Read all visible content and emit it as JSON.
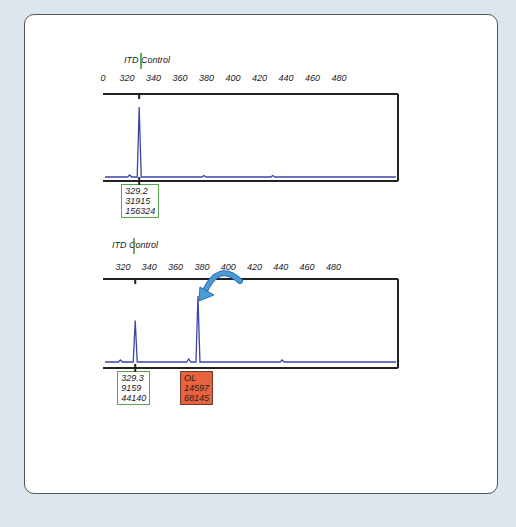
{
  "chart_data": [
    {
      "type": "line",
      "title": "ITD Control",
      "xlabel": "",
      "ylabel": "",
      "xlim": [
        310,
        500
      ],
      "x_ticks": [
        300,
        320,
        340,
        360,
        380,
        400,
        420,
        440,
        460,
        480
      ],
      "x_tick_labels": [
        "0",
        "320",
        "340",
        "360",
        "380",
        "400",
        "420",
        "440",
        "460",
        "480"
      ],
      "series": [
        {
          "name": "ITD Control trace",
          "color": "#3c46a8",
          "peaks": [
            {
              "x": 329.2,
              "height": 31915,
              "area": 156324
            }
          ]
        }
      ],
      "peak_labels": [
        {
          "lines": [
            "329.2",
            "31915",
            "156324"
          ],
          "status": "ok",
          "x": 329.2
        }
      ],
      "marker_x": 329.2
    },
    {
      "type": "line",
      "title": "ITD Control",
      "xlabel": "",
      "ylabel": "",
      "xlim": [
        310,
        500
      ],
      "x_ticks": [
        320,
        340,
        360,
        380,
        400,
        420,
        440,
        460,
        480
      ],
      "x_tick_labels": [
        "320",
        "340",
        "360",
        "380",
        "400",
        "420",
        "440",
        "460",
        "480"
      ],
      "series": [
        {
          "name": "ITD Control trace",
          "color": "#3c46a8",
          "peaks": [
            {
              "x": 329.3,
              "height": 9159,
              "area": 44140
            },
            {
              "x": 377,
              "height": 14597,
              "area": 68145
            }
          ]
        }
      ],
      "peak_labels": [
        {
          "lines": [
            "329.3",
            "9159",
            "44140"
          ],
          "status": "ok",
          "x": 329.3
        },
        {
          "lines": [
            "OL",
            "14597",
            "68145"
          ],
          "status": "ol",
          "x": 377
        }
      ],
      "marker_x": 329.3,
      "annotation": {
        "type": "arrow",
        "target_x": 377,
        "color": "#4a9ad8"
      }
    }
  ],
  "colors": {
    "background": "#dde6ee",
    "trace": "#3c46a8",
    "ok_border": "#5aa64a",
    "ol_fill": "#e8623e",
    "arrow": "#4a9ad8"
  }
}
